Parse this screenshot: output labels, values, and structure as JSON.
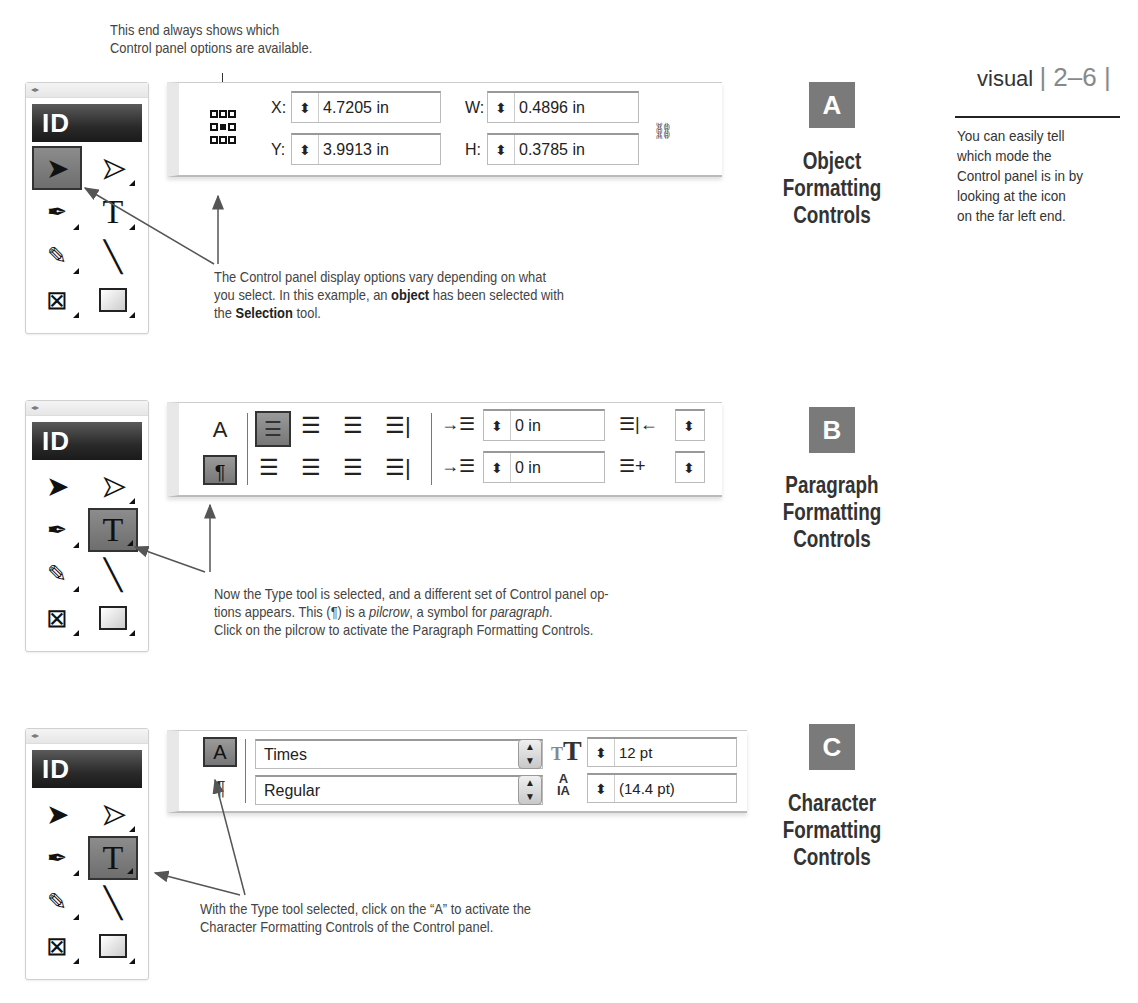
{
  "page_header": {
    "label": "visual",
    "page": "2–6"
  },
  "sidebar_note": [
    "You can easily tell",
    "which mode the",
    "Control panel is in by",
    "looking at the icon",
    "on the far left end."
  ],
  "top_callout": [
    "This end always shows which",
    "Control panel options are available."
  ],
  "toolbox": {
    "grip": "◂▸",
    "logo": "ID",
    "tools": [
      "selection-tool",
      "direct-selection-tool",
      "pen-tool",
      "type-tool",
      "pencil-tool",
      "line-tool",
      "rectangle-frame-tool",
      "rectangle-tool"
    ]
  },
  "sections": {
    "A": {
      "badge": "A",
      "title": [
        "Object",
        "Formatting",
        "Controls"
      ],
      "selected_tool": "selection-tool",
      "fields": [
        {
          "label": "X:",
          "value": "4.7205 in"
        },
        {
          "label": "Y:",
          "value": "3.9913 in"
        },
        {
          "label": "W:",
          "value": "0.4896 in"
        },
        {
          "label": "H:",
          "value": "0.3785 in"
        }
      ],
      "caption": [
        "The Control panel display options vary depending on what",
        "you select. In this example, an ",
        "object",
        " has been selected with",
        "the ",
        "Selection",
        " tool."
      ]
    },
    "B": {
      "badge": "B",
      "title": [
        "Paragraph",
        "Formatting",
        "Controls"
      ],
      "selected_tool": "type-tool",
      "mode_buttons": {
        "character": "A",
        "paragraph": "¶"
      },
      "fields": [
        {
          "name": "left-indent",
          "value": "0 in"
        },
        {
          "name": "first-line-indent",
          "value": "0 in"
        }
      ],
      "caption": [
        "Now the Type tool is selected,  and a different set of Control panel op-",
        "tions appears. This (¶) is a ",
        "pilcrow",
        ", a symbol for ",
        "paragraph",
        ".",
        "Click on the pilcrow to activate the Paragraph Formatting Controls."
      ]
    },
    "C": {
      "badge": "C",
      "title": [
        "Character",
        "Formatting",
        "Controls"
      ],
      "selected_tool": "type-tool",
      "mode_buttons": {
        "character": "A",
        "paragraph": "¶"
      },
      "font_family": "Times",
      "font_style": "Regular",
      "font_size": "12 pt",
      "leading": "(14.4 pt)",
      "caption": [
        "With the Type tool selected, click on the “A” to activate the",
        "Character Formatting Controls of the Control panel."
      ]
    }
  }
}
